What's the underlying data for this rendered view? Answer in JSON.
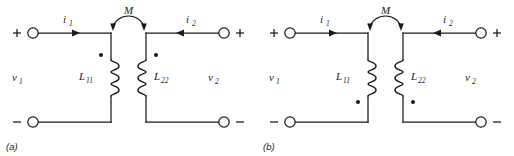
{
  "figure": {
    "panels": [
      {
        "id": "a",
        "caption": "(a)",
        "mutual_label": "M",
        "dot_position": "top",
        "left_port": {
          "plus_label": "+",
          "minus_label": "−",
          "voltage_label": "v",
          "voltage_sub": "1",
          "current_label": "i",
          "current_sub": "1",
          "current_direction": "right"
        },
        "right_port": {
          "plus_label": "+",
          "minus_label": "−",
          "voltage_label": "v",
          "voltage_sub": "2",
          "current_label": "i",
          "current_sub": "2",
          "current_direction": "left"
        },
        "left_inductor": {
          "label": "L",
          "sub": "11",
          "label_side": "left",
          "coil_bulge": "right"
        },
        "right_inductor": {
          "label": "L",
          "sub": "22",
          "label_side": "right",
          "coil_bulge": "left"
        }
      },
      {
        "id": "b",
        "caption": "(b)",
        "mutual_label": "M",
        "dot_position": "bottom",
        "left_port": {
          "plus_label": "+",
          "minus_label": "−",
          "voltage_label": "v",
          "voltage_sub": "1",
          "current_label": "i",
          "current_sub": "1",
          "current_direction": "right"
        },
        "right_port": {
          "plus_label": "+",
          "minus_label": "−",
          "voltage_label": "v",
          "voltage_sub": "2",
          "current_label": "i",
          "current_sub": "2",
          "current_direction": "left"
        },
        "left_inductor": {
          "label": "L",
          "sub": "11",
          "label_side": "left",
          "coil_bulge": "right"
        },
        "right_inductor": {
          "label": "L",
          "sub": "22",
          "label_side": "right",
          "coil_bulge": "left"
        }
      }
    ],
    "colors": {
      "ink": "#1a1a1a",
      "background": "#ffffff"
    }
  }
}
